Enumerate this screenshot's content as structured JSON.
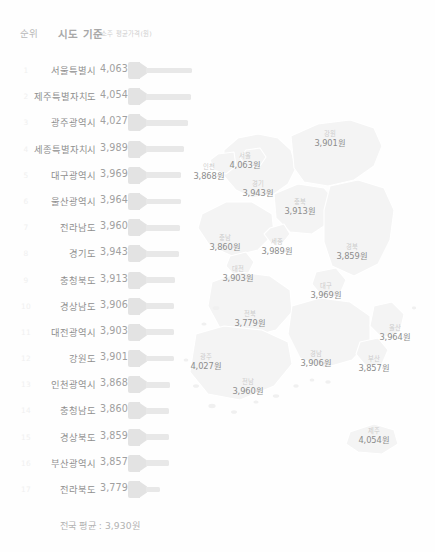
{
  "header": {
    "rank_label": "순위",
    "region_label": "시도 기준",
    "unit_label": "소주 평균가격(원)"
  },
  "ranking": {
    "rows": [
      {
        "rank": "1",
        "name": "서울특별시",
        "value": "4,063",
        "num": 4063
      },
      {
        "rank": "2",
        "name": "제주특별자치도",
        "value": "4,054",
        "num": 4054
      },
      {
        "rank": "3",
        "name": "광주광역시",
        "value": "4,027",
        "num": 4027
      },
      {
        "rank": "4",
        "name": "세종특별자치시",
        "value": "3,989",
        "num": 3989
      },
      {
        "rank": "5",
        "name": "대구광역시",
        "value": "3,969",
        "num": 3969
      },
      {
        "rank": "6",
        "name": "울산광역시",
        "value": "3,964",
        "num": 3964
      },
      {
        "rank": "7",
        "name": "전라남도",
        "value": "3,960",
        "num": 3960
      },
      {
        "rank": "8",
        "name": "경기도",
        "value": "3,943",
        "num": 3943
      },
      {
        "rank": "9",
        "name": "충청북도",
        "value": "3,913",
        "num": 3913
      },
      {
        "rank": "10",
        "name": "경상남도",
        "value": "3,906",
        "num": 3906
      },
      {
        "rank": "11",
        "name": "대전광역시",
        "value": "3,903",
        "num": 3903
      },
      {
        "rank": "12",
        "name": "강원도",
        "value": "3,901",
        "num": 3901
      },
      {
        "rank": "13",
        "name": "인천광역시",
        "value": "3,868",
        "num": 3868
      },
      {
        "rank": "14",
        "name": "충청남도",
        "value": "3,860",
        "num": 3860
      },
      {
        "rank": "15",
        "name": "경상북도",
        "value": "3,859",
        "num": 3859
      },
      {
        "rank": "16",
        "name": "부산광역시",
        "value": "3,857",
        "num": 3857
      },
      {
        "rank": "17",
        "name": "전라북도",
        "value": "3,779",
        "num": 3779
      }
    ]
  },
  "footer": {
    "national_average": "전국 평균 : 3,930원"
  },
  "map": {
    "title": "대한민국 시도별 소주 평균가격",
    "regions": [
      {
        "id": "gangwon",
        "name": "강원",
        "value": "3,901원",
        "x": 152,
        "y": 20
      },
      {
        "id": "seoul",
        "name": "서울",
        "value": "4,063원",
        "x": 67,
        "y": 42
      },
      {
        "id": "incheon",
        "name": "인천",
        "value": "3,868원",
        "x": 31,
        "y": 53
      },
      {
        "id": "gyeonggi",
        "name": "경기",
        "value": "3,943원",
        "x": 80,
        "y": 70
      },
      {
        "id": "chungbuk",
        "name": "충북",
        "value": "3,913원",
        "x": 122,
        "y": 88
      },
      {
        "id": "chungnam",
        "name": "충남",
        "value": "3,860원",
        "x": 47,
        "y": 124
      },
      {
        "id": "sejong",
        "name": "세종",
        "value": "3,989원",
        "x": 99,
        "y": 128
      },
      {
        "id": "gyeongbuk",
        "name": "경북",
        "value": "3,859원",
        "x": 174,
        "y": 133
      },
      {
        "id": "daejeon",
        "name": "대전",
        "value": "3,903원",
        "x": 60,
        "y": 155
      },
      {
        "id": "daegu",
        "name": "대구",
        "value": "3,969원",
        "x": 148,
        "y": 172
      },
      {
        "id": "jeonbuk",
        "name": "전북",
        "value": "3,779원",
        "x": 72,
        "y": 200
      },
      {
        "id": "ulsan",
        "name": "울산",
        "value": "3,964원",
        "x": 217,
        "y": 214
      },
      {
        "id": "gwangju",
        "name": "광주",
        "value": "4,027원",
        "x": 28,
        "y": 243
      },
      {
        "id": "gyeongnam",
        "name": "경남",
        "value": "3,906원",
        "x": 138,
        "y": 240
      },
      {
        "id": "busan",
        "name": "부산",
        "value": "3,857원",
        "x": 196,
        "y": 245
      },
      {
        "id": "jeonnam",
        "name": "전남",
        "value": "3,960원",
        "x": 70,
        "y": 268
      },
      {
        "id": "jeju",
        "name": "제주",
        "value": "4,054원",
        "x": 196,
        "y": 317
      }
    ]
  },
  "style": {
    "bar_color": "#e3e3e3",
    "map_fill": "#f4f4f4",
    "map_stroke": "#ffffff",
    "text_color": "#8f8f8f",
    "background": "#ffffff"
  },
  "chart_data": {
    "type": "bar",
    "title": "시도 기준 소주 평균가격(원)",
    "xlabel": "",
    "ylabel": "소주 평균가격(원)",
    "categories": [
      "서울특별시",
      "제주특별자치도",
      "광주광역시",
      "세종특별자치시",
      "대구광역시",
      "울산광역시",
      "전라남도",
      "경기도",
      "충청북도",
      "경상남도",
      "대전광역시",
      "강원도",
      "인천광역시",
      "충청남도",
      "경상북도",
      "부산광역시",
      "전라북도"
    ],
    "values": [
      4063,
      4054,
      4027,
      3989,
      3969,
      3964,
      3960,
      3943,
      3913,
      3906,
      3903,
      3901,
      3868,
      3860,
      3859,
      3857,
      3779
    ],
    "ylim": [
      3700,
      4100
    ],
    "grid": false,
    "legend": null,
    "annotations": [
      "전국 평균 : 3,930원"
    ]
  }
}
